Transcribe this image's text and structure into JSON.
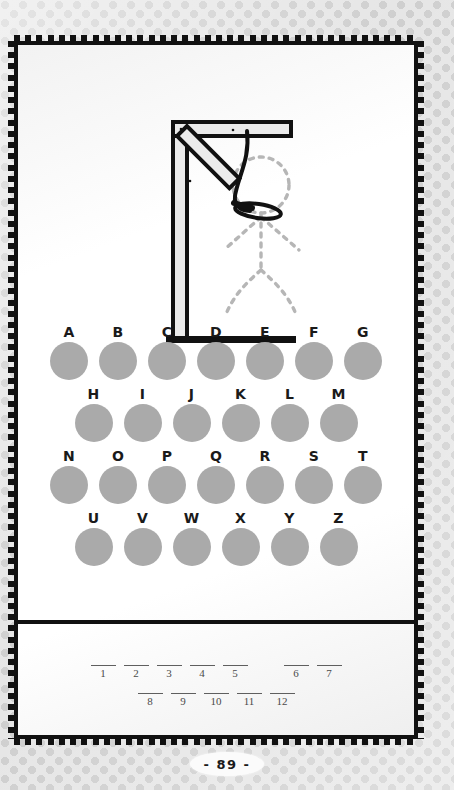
{
  "page": {
    "number_label": "- 89 -",
    "page_number": 89,
    "background": "#e6e6e6",
    "dot_color": "#cfcfcf",
    "frame_color": "#111111",
    "paper_color": "#ffffff"
  },
  "puzzle": {
    "type": "hangman",
    "title": "Hangman",
    "gallows": {
      "description": "hangman gallows with noose and dotted stick-figure outline",
      "post_color": "#e9e9e9",
      "outline_color": "#111111",
      "figure_style": "dotted",
      "figure_color": "#b3b3b3",
      "parts_drawn": 0,
      "parts_total": 6
    },
    "alphabet": {
      "letter_color": "#1a1a1a",
      "circle_color": "#aaaaaa",
      "rows": [
        [
          "A",
          "B",
          "C",
          "D",
          "E",
          "F",
          "G"
        ],
        [
          "H",
          "I",
          "J",
          "K",
          "L",
          "M"
        ],
        [
          "N",
          "O",
          "P",
          "Q",
          "R",
          "S",
          "T"
        ],
        [
          "U",
          "V",
          "W",
          "X",
          "Y",
          "Z"
        ]
      ]
    },
    "answer": {
      "line_color": "#5f5f5f",
      "number_color": "#4a4a4a",
      "rows": [
        {
          "groups": [
            {
              "numbers": [
                "1",
                "2",
                "3",
                "4",
                "5"
              ],
              "values": [
                "",
                "",
                "",
                "",
                ""
              ]
            },
            {
              "numbers": [
                "6",
                "7"
              ],
              "values": [
                "",
                ""
              ]
            }
          ]
        },
        {
          "groups": [
            {
              "numbers": [
                "8",
                "9",
                "10",
                "11",
                "12"
              ],
              "values": [
                "",
                "",
                "",
                "",
                ""
              ]
            }
          ]
        }
      ]
    }
  }
}
